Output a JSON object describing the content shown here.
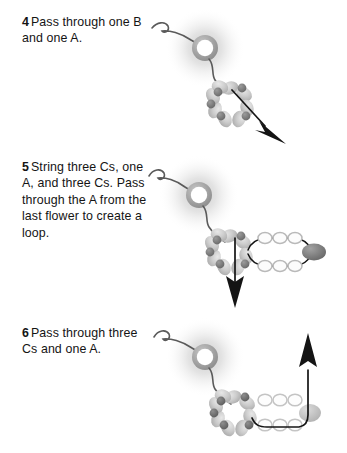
{
  "page": {
    "background_color": "#ffffff",
    "text_color": "#141414",
    "width": 347,
    "height": 453
  },
  "palette": {
    "thread": "#5a5a5a",
    "arrow": "#111111",
    "ring_bead_outline": "#9a9a9a",
    "ring_bead_center": "#ffffff",
    "glow": "#b8b8b8",
    "petal_light": "#cfcfcf",
    "petal_mid": "#bdbdbd",
    "accent_dark_bead": "#6f6f6f",
    "seed_bead_outline": "#c2c2c2",
    "seed_bead_fill": "#fdfdfd",
    "loop_end_bead_dark": "#717171",
    "loop_end_bead_light": "#c9c9c9"
  },
  "steps": [
    {
      "number": "4",
      "text": "Pass through one B and one A.",
      "figure": {
        "name": "step-4-diagram",
        "ring_bead": {
          "label": "ring-bead",
          "cx": 58,
          "cy": 48
        },
        "flower": {
          "label": "flower-bead-cluster",
          "cx": 83,
          "cy": 103,
          "petals": 8
        },
        "arrow": {
          "label": "arrow-down-right",
          "direction": "down-right"
        },
        "loop_beads": {
          "top": 0,
          "bottom": 0,
          "end_bead": false
        }
      }
    },
    {
      "number": "5",
      "text": "String three Cs, one A, and three Cs. Pass through the A from the last flower to create a loop.",
      "figure": {
        "name": "step-5-diagram",
        "ring_bead": {
          "label": "ring-bead",
          "cx": 52,
          "cy": 45
        },
        "flower": {
          "label": "flower-bead-cluster",
          "cx": 82,
          "cy": 100,
          "petals": 8
        },
        "arrow": {
          "label": "arrow-down",
          "direction": "down"
        },
        "loop_beads": {
          "top": 3,
          "bottom": 3,
          "end_bead": true
        }
      }
    },
    {
      "number": "6",
      "text": "Pass through three Cs and one A.",
      "figure": {
        "name": "step-6-diagram",
        "ring_bead": {
          "label": "ring-bead",
          "cx": 58,
          "cy": 42
        },
        "flower": {
          "label": "flower-bead-cluster",
          "cx": 86,
          "cy": 95,
          "petals": 8
        },
        "arrow": {
          "label": "arrow-up",
          "direction": "up"
        },
        "loop_beads": {
          "top": 3,
          "bottom": 3,
          "end_bead": true
        }
      }
    }
  ]
}
